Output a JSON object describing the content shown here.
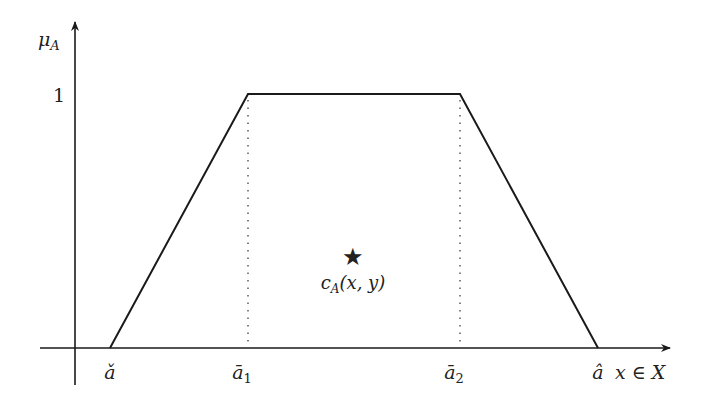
{
  "diagram": {
    "type": "trapezoidal-membership-function",
    "colors": {
      "stroke": "#1a1a1a",
      "background": "#ffffff"
    },
    "y_axis": {
      "label_main": "μ",
      "label_sub": "A",
      "tick_label": "1"
    },
    "x_axis": {
      "label": "x ∈ X"
    },
    "points": {
      "a_check": {
        "label": "ǎ"
      },
      "a_bar_1": {
        "label_main": "ā",
        "label_sub": "1"
      },
      "a_bar_2": {
        "label_main": "ā",
        "label_sub": "2"
      },
      "a_hat": {
        "label": "â"
      }
    },
    "centroid": {
      "marker": "★",
      "label_main": "c",
      "label_sub": "A",
      "label_args": "(x, y)"
    }
  }
}
